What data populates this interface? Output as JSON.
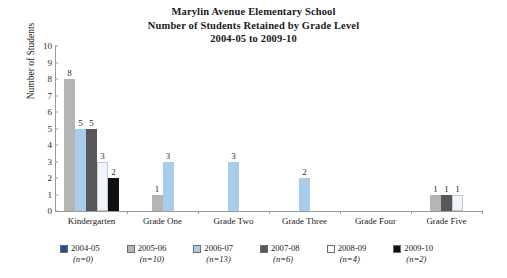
{
  "title": {
    "line1": "Marylin Avenue Elementary School",
    "line2": "Number of Students Retained by Grade Level",
    "line3": "2004-05 to 2009-10"
  },
  "axes": {
    "y_title": "Number of Students",
    "y_ticks": [
      "10",
      "9",
      "8",
      "7",
      "6",
      "5",
      "4",
      "3",
      "2",
      "1",
      "0"
    ]
  },
  "legend": {
    "items": [
      {
        "label": "2004-05",
        "n": "(n=0)",
        "color": "#1f4e9c"
      },
      {
        "label": "2005-06",
        "n": "(n=10)",
        "color": "#b5b5b5"
      },
      {
        "label": "2006-07",
        "n": "(n=13)",
        "color": "#a8cdec"
      },
      {
        "label": "2007-08",
        "n": "(n=6)",
        "color": "#585858"
      },
      {
        "label": "2008-09",
        "n": "(n=4)",
        "color": "#ffffff"
      },
      {
        "label": "2009-10",
        "n": "(n=2)",
        "color": "#111111"
      }
    ]
  },
  "chart_data": {
    "type": "bar",
    "title": "Marylin Avenue Elementary School Number of Students Retained by Grade Level 2004-05 to 2009-10",
    "xlabel": "",
    "ylabel": "Number of Students",
    "ylim": [
      0,
      10
    ],
    "grid": false,
    "legend_position": "bottom",
    "categories": [
      "Kindergarten",
      "Grade One",
      "Grade Two",
      "Grade Three",
      "Grade Four",
      "Grade Five"
    ],
    "series": [
      {
        "name": "2004-05",
        "color": "#1f4e9c",
        "values": [
          null,
          null,
          null,
          null,
          null,
          null
        ]
      },
      {
        "name": "2005-06",
        "color": "#b5b5b5",
        "values": [
          8,
          1,
          null,
          null,
          null,
          1
        ]
      },
      {
        "name": "2006-07",
        "color": "#a8cdec",
        "values": [
          5,
          3,
          3,
          2,
          null,
          null
        ]
      },
      {
        "name": "2007-08",
        "color": "#585858",
        "values": [
          5,
          null,
          null,
          null,
          null,
          1
        ]
      },
      {
        "name": "2008-09",
        "color": "#ffffff",
        "values": [
          3,
          null,
          null,
          null,
          null,
          1
        ]
      },
      {
        "name": "2009-10",
        "color": "#111111",
        "values": [
          2,
          null,
          null,
          null,
          null,
          null
        ]
      }
    ]
  }
}
